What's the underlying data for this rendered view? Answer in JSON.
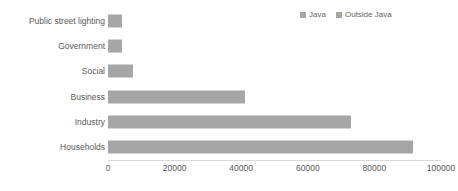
{
  "chart_data": {
    "type": "bar",
    "orientation": "horizontal",
    "title": "",
    "xlabel": "",
    "ylabel": "",
    "xlim": [
      0,
      100000
    ],
    "xticks": [
      0,
      20000,
      40000,
      60000,
      80000,
      100000
    ],
    "xtick_labels": [
      "0",
      "20000",
      "40000",
      "60000",
      "80000",
      "100000"
    ],
    "grid": false,
    "legend_position": "top-right",
    "categories": [
      "Public street lighting",
      "Government",
      "Social",
      "Business",
      "Industry",
      "Households"
    ],
    "series": [
      {
        "name": "Java",
        "color": "#a6a6a6",
        "values": [
          4200,
          4200,
          7500,
          41000,
          73000,
          91500
        ]
      },
      {
        "name": "Outside Java",
        "color": "#a6a6a6",
        "values": [
          0,
          0,
          0,
          0,
          0,
          0
        ]
      }
    ]
  },
  "legend": {
    "entries": [
      {
        "label": "Java",
        "color": "#a6a6a6"
      },
      {
        "label": "Outside Java",
        "color": "#a6a6a6"
      }
    ]
  },
  "colors": {
    "bar": "#a6a6a6",
    "text": "#595959",
    "legend_text": "#636363",
    "axis_line": "#d9d9d9",
    "background": "#ffffff"
  }
}
